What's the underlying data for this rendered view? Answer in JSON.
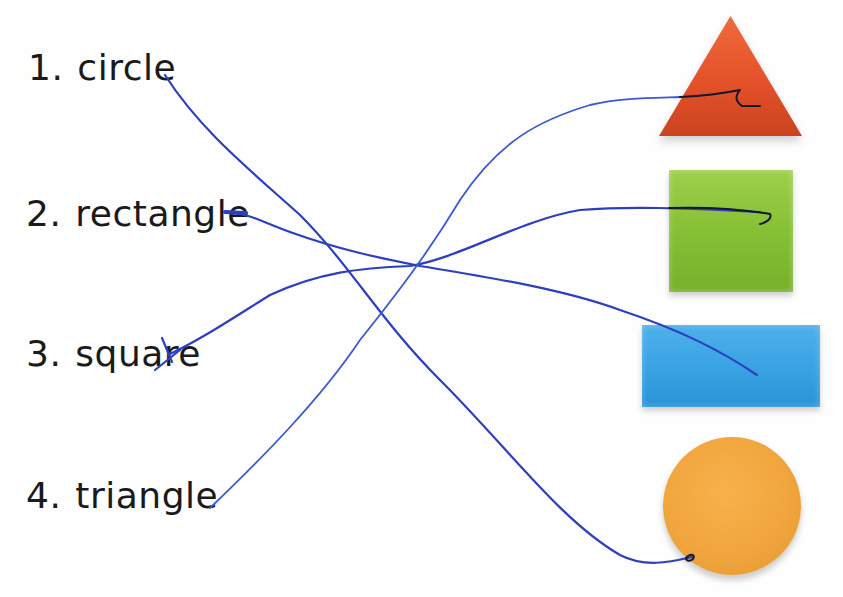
{
  "worksheet": {
    "task": "match words to shapes",
    "words": [
      {
        "number": "1.",
        "word": "circle"
      },
      {
        "number": "2.",
        "word": "rectangle"
      },
      {
        "number": "3.",
        "word": "square"
      },
      {
        "number": "4.",
        "word": "triangle"
      }
    ],
    "shapes": [
      {
        "name": "triangle",
        "color": "#e4512a"
      },
      {
        "name": "square",
        "color": "#86c035"
      },
      {
        "name": "rectangle",
        "color": "#38a2e3"
      },
      {
        "name": "circle",
        "color": "#f1a53d"
      }
    ],
    "connections": [
      {
        "from": "circle",
        "to": "circle"
      },
      {
        "from": "rectangle",
        "to": "rectangle"
      },
      {
        "from": "square",
        "to": "square"
      },
      {
        "from": "triangle",
        "to": "triangle"
      }
    ],
    "pen_color": "#2c3fc0"
  }
}
